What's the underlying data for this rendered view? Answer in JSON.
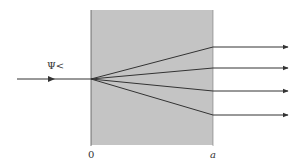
{
  "diagram": {
    "title": "",
    "labels": {
      "incident_wave": "Ψ<",
      "left_boundary": "0",
      "right_boundary": "a"
    },
    "colors": {
      "slab_fill": "#c4c4c4",
      "lines": "#333333",
      "background": "#ffffff"
    },
    "slab": {
      "x_start": 0,
      "x_end": "a"
    },
    "incident_ray": {
      "y": 79
    },
    "outgoing_rays": [
      {
        "id": 1,
        "exit_y": 47
      },
      {
        "id": 2,
        "exit_y": 68
      },
      {
        "id": 3,
        "exit_y": 91
      },
      {
        "id": 4,
        "exit_y": 115
      }
    ]
  }
}
